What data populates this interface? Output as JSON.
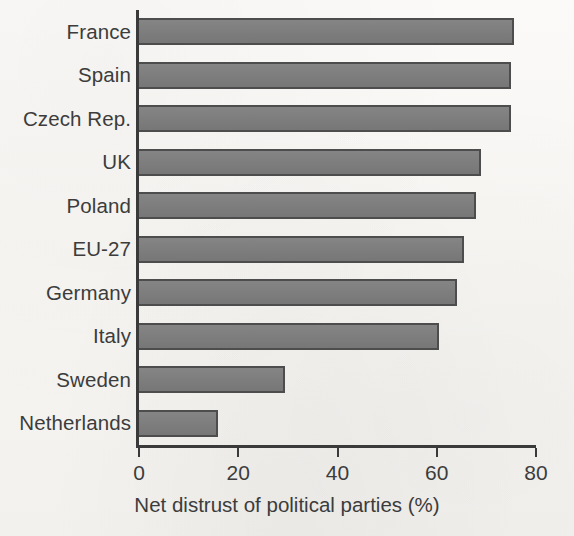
{
  "figure": {
    "background_color": "#f8f7f5",
    "ink_color": "#3a3a3a",
    "bar_fill_color": "#7d7d7d",
    "bar_edge_color": "#4d4d4d"
  },
  "chart_data": {
    "type": "bar",
    "orientation": "horizontal",
    "title": "",
    "subtitle": "",
    "xlabel": "Net distrust of political parties (%)",
    "ylabel": "",
    "xlim": [
      0,
      80
    ],
    "xticks": [
      0,
      20,
      40,
      60,
      80
    ],
    "xtick_labels": [
      "0",
      "20",
      "40",
      "60",
      "80"
    ],
    "grid": false,
    "legend": false,
    "legend_position": "none",
    "categories": [
      "France",
      "Spain",
      "Czech Rep.",
      "UK",
      "Poland",
      "EU-27",
      "Germany",
      "Italy",
      "Sweden",
      "Netherlands"
    ],
    "values": [
      75.5,
      75,
      75,
      69,
      68,
      65.5,
      64,
      60.5,
      29.5,
      16
    ],
    "series": [
      {
        "name": "Net distrust of political parties (%)",
        "values": [
          75.5,
          75,
          75,
          69,
          68,
          65.5,
          64,
          60.5,
          29.5,
          16
        ]
      }
    ],
    "annotations": []
  }
}
